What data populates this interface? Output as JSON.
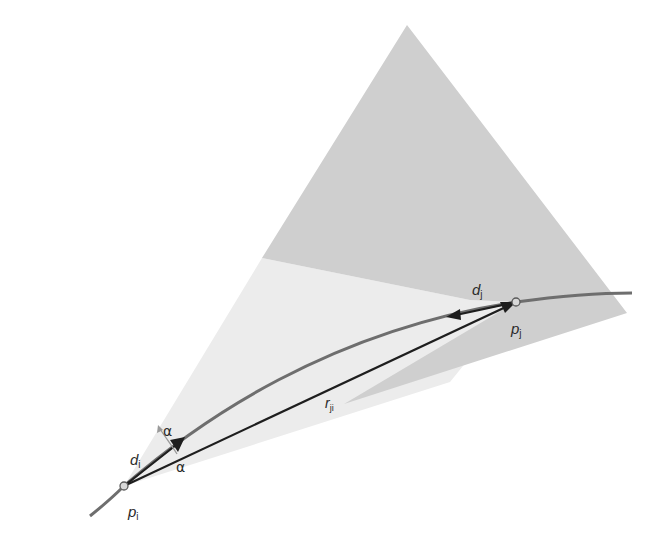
{
  "diagram": {
    "type": "geometric-vector-diagram",
    "colors": {
      "background": "#ffffff",
      "cone_j": "#cfcfcf",
      "cone_i": "#ececec",
      "curve": "#6e6e6e",
      "vectors": "#1e1e1e",
      "alpha_arrow": "#9a9a9a"
    },
    "points": [
      {
        "id": "pi",
        "label": "p",
        "subscript": "i"
      },
      {
        "id": "pj",
        "label": "p",
        "subscript": "j"
      }
    ],
    "vectors": [
      {
        "id": "di",
        "label": "d",
        "subscript": "i",
        "from": "pi"
      },
      {
        "id": "dj",
        "label": "d",
        "subscript": "j",
        "from": "pj"
      },
      {
        "id": "rji",
        "label": "r",
        "subscript": "ji",
        "from": "pi",
        "to": "pj"
      }
    ],
    "angles": [
      {
        "id": "alpha-upper",
        "label": "α"
      },
      {
        "id": "alpha-lower",
        "label": "α"
      }
    ]
  }
}
